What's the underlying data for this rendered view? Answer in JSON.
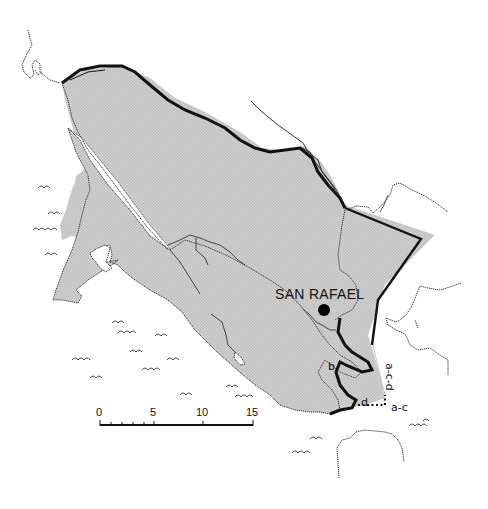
{
  "map": {
    "region": "Marin County",
    "colors": {
      "land_fill": "#cfcfcf",
      "land_hatch": "#b8b8b8",
      "boundary": "#111111",
      "water": "#ffffff",
      "coastline": "#222222"
    },
    "places": [
      {
        "name": "SAN RAFAEL",
        "type": "city",
        "marker": "filled-circle"
      }
    ],
    "boundary_labels": [
      {
        "id": "b",
        "text": "b"
      },
      {
        "id": "d",
        "text": "d"
      },
      {
        "id": "a-c-d",
        "text": "a-c-d"
      },
      {
        "id": "a-c",
        "text": "a-c"
      }
    ],
    "scale_bar": {
      "ticks": [
        "0",
        "5",
        "10",
        "15"
      ],
      "minor_divisions": 5
    }
  }
}
